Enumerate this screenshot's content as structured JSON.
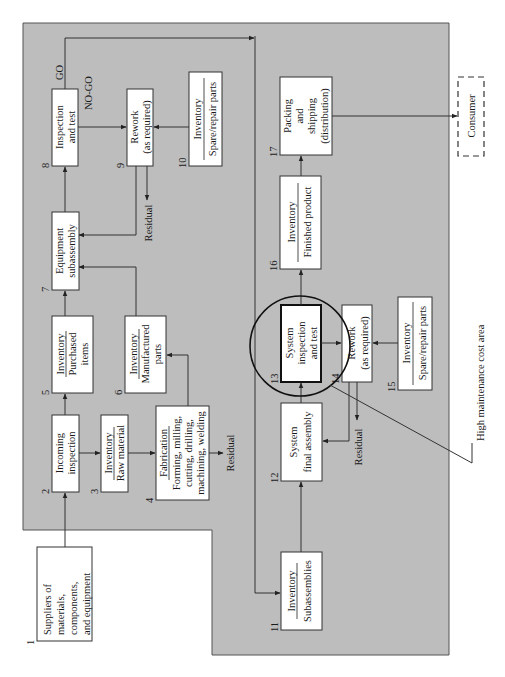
{
  "figure": {
    "panel_color": "#bdbdbd",
    "orientation": "rotated 90 degrees counter-clockwise",
    "callout": "High maintenance cost area",
    "external": {
      "supplier": {
        "num": "1",
        "lines": [
          "Suppliers of",
          "materials,",
          "components,",
          "and equipment"
        ]
      },
      "consumer": {
        "label": "Consumer"
      }
    },
    "nodes": {
      "n2": {
        "num": "2",
        "lines": [
          "Incoming",
          "inspection"
        ]
      },
      "n3": {
        "num": "3",
        "title": "Inventory",
        "sub": [
          "Raw material"
        ]
      },
      "n4": {
        "num": "4",
        "title": "Fabrication",
        "sub": [
          "Forming, milling,",
          "cutting, drilling,",
          "machining, welding"
        ]
      },
      "n5": {
        "num": "5",
        "title": "Inventory",
        "sub": [
          "Purchased",
          "items"
        ]
      },
      "n6": {
        "num": "6",
        "title": "Inventory",
        "sub": [
          "Manufactured",
          "parts"
        ]
      },
      "n7": {
        "num": "7",
        "lines": [
          "Equipment",
          "subassembly"
        ]
      },
      "n8": {
        "num": "8",
        "lines": [
          "Inspection",
          "and test"
        ]
      },
      "n9": {
        "num": "9",
        "lines": [
          "Rework",
          "(as required)"
        ]
      },
      "n10": {
        "num": "10",
        "title": "Inventory",
        "sub": [
          "Spare/repair parts"
        ]
      },
      "n11": {
        "num": "11",
        "title": "Inventory",
        "sub": [
          "Subassemblies"
        ]
      },
      "n12": {
        "num": "12",
        "lines": [
          "System",
          "final assembly"
        ]
      },
      "n13": {
        "num": "13",
        "lines": [
          "System",
          "inspection",
          "and test"
        ]
      },
      "n14": {
        "num": "14",
        "lines": [
          "Rework",
          "(as required)"
        ]
      },
      "n15": {
        "num": "15",
        "title": "Inventory",
        "sub": [
          "Spare/repair parts"
        ]
      },
      "n16": {
        "num": "16",
        "title": "Inventory",
        "sub": [
          "Finished product"
        ]
      },
      "n17": {
        "num": "17",
        "lines": [
          "Packing",
          "and",
          "shipping",
          "(distribution)"
        ]
      }
    },
    "edge_labels": {
      "go": "GO",
      "nogo": "NO-GO",
      "residual_4": "Residual",
      "residual_9": "Residual",
      "residual_14": "Residual"
    }
  }
}
